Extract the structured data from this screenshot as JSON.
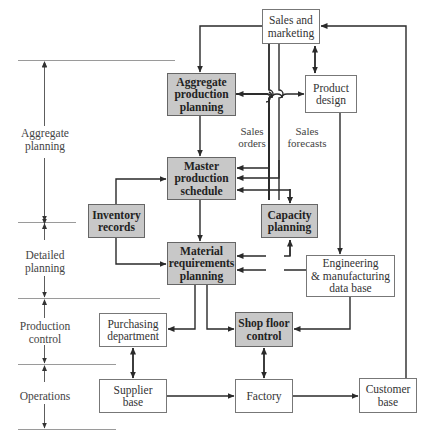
{
  "diagram": {
    "type": "production planning and control hierarchy flowchart",
    "colors": {
      "shaded_box": "#c8c8c8",
      "line": "#2a2a2a",
      "band_rule": "#999999"
    },
    "bands": [
      {
        "id": "aggregate",
        "label": "Aggregate\nplanning"
      },
      {
        "id": "detailed",
        "label": "Detailed\nplanning"
      },
      {
        "id": "production",
        "label": "Production\ncontrol"
      },
      {
        "id": "operations",
        "label": "Operations"
      }
    ],
    "nodes": {
      "sales": {
        "label": "Sales and\nmarketing",
        "shaded": false
      },
      "app": {
        "label": "Aggregate\nproduction\nplanning",
        "shaded": true
      },
      "design": {
        "label": "Product\ndesign",
        "shaded": false
      },
      "mps": {
        "label": "Master\nproduction\nschedule",
        "shaded": true
      },
      "inventory": {
        "label": "Inventory\nrecords",
        "shaded": true
      },
      "capacity": {
        "label": "Capacity\nplanning",
        "shaded": true
      },
      "mrp": {
        "label": "Material\nrequirements\nplanning",
        "shaded": true
      },
      "engdb": {
        "label": "Engineering\n& manufacturing\ndata base",
        "shaded": false
      },
      "purchasing": {
        "label": "Purchasing\ndepartment",
        "shaded": false
      },
      "shopfloor": {
        "label": "Shop floor\ncontrol",
        "shaded": true
      },
      "supplier": {
        "label": "Supplier\nbase",
        "shaded": false
      },
      "factory": {
        "label": "Factory",
        "shaded": false
      },
      "customer": {
        "label": "Customer\nbase",
        "shaded": false
      }
    },
    "flow_labels": {
      "sales_orders": "Sales\norders",
      "sales_forecasts": "Sales\nforecasts"
    },
    "edges": [
      {
        "from": "sales",
        "to": "app",
        "label": ""
      },
      {
        "from": "sales",
        "to": "design",
        "bidirectional": true
      },
      {
        "from": "app",
        "to": "design",
        "bidirectional": true
      },
      {
        "from": "sales",
        "to": "mps",
        "label": "Sales orders"
      },
      {
        "from": "sales",
        "to": "mps",
        "label": "Sales forecasts"
      },
      {
        "from": "app",
        "to": "mps"
      },
      {
        "from": "mps",
        "to": "capacity",
        "bidirectional": true
      },
      {
        "from": "inventory",
        "to": "mps"
      },
      {
        "from": "inventory",
        "to": "mrp"
      },
      {
        "from": "mps",
        "to": "mrp"
      },
      {
        "from": "capacity",
        "to": "mrp",
        "bidirectional": true
      },
      {
        "from": "design",
        "to": "engdb"
      },
      {
        "from": "engdb",
        "to": "mrp"
      },
      {
        "from": "mrp",
        "to": "purchasing"
      },
      {
        "from": "mrp",
        "to": "shopfloor"
      },
      {
        "from": "engdb",
        "to": "shopfloor"
      },
      {
        "from": "purchasing",
        "to": "supplier",
        "bidirectional": true
      },
      {
        "from": "shopfloor",
        "to": "factory",
        "bidirectional": true
      },
      {
        "from": "supplier",
        "to": "factory"
      },
      {
        "from": "factory",
        "to": "customer"
      },
      {
        "from": "customer",
        "to": "sales"
      }
    ]
  }
}
